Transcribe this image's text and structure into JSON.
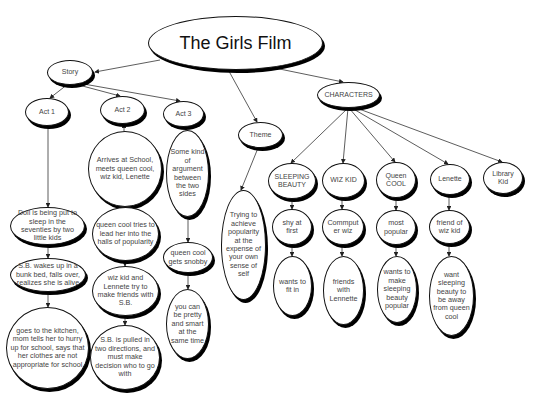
{
  "title": "The Girls Film",
  "nodes": {
    "root": "The Girls Film",
    "story": "Story",
    "act1": "Act 1",
    "act2": "Act 2",
    "act3": "Act 3",
    "theme": "Theme",
    "characters": "CHARACTERS",
    "act1_1": "Doll is being put to sleep in the seventies by two little kids",
    "act1_2": "S.B. wakes up in a bunk bed, falls over, realizes she is alive",
    "act1_3": "goes to the kitchen, mom tells her to hurry up for school, says that her clothes are not appropriate for school",
    "act2_1": "Arrives at School, meets queen cool, wiz kid, Lenette",
    "act2_2": "queen cool tries to lead her into the halls of popularity",
    "act2_3": "wiz kid and Lennete try to make friends with S.B.",
    "act2_4": "S.B. is pulled in two directions, and must make decision who to go with",
    "act3_1": "Some kind of argument between the two sides",
    "act3_2": "queen cool gets snobby",
    "act3_3": "you can be pretty and smart at the same time",
    "theme_1": "Trying to achieve popularity at the expense of your own sense of self",
    "sleeping_beauty": "SLEEPING BEAUTY",
    "wiz_kid": "WIZ KID",
    "queen_cool": "Queen COOL",
    "lenette": "Lenette",
    "library_kid": "Library Kid",
    "sb_1": "shy at first",
    "sb_2": "wants to fit in",
    "wk_1": "Commput er wiz",
    "wk_2": "friends with Lennette",
    "qc_1": "most popular",
    "qc_2": "wants to make sleeping beauty popular",
    "len_1": "friend of wiz kid",
    "len_2": "want sleeping beauty to be away from queen cool"
  },
  "colors": {
    "outline": "#111111",
    "shadow": "#000000",
    "text": "#444444",
    "edge": "#333333"
  }
}
